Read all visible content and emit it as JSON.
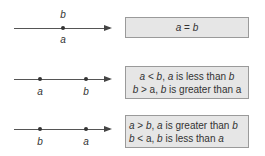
{
  "diagram": {
    "rows": [
      {
        "line": {
          "points": [
            {
              "label_above": "b",
              "label_below": "a",
              "x": 63
            }
          ]
        },
        "box": {
          "lines": [
            "a = b"
          ],
          "align": "center"
        }
      },
      {
        "line": {
          "points": [
            {
              "label_below": "a",
              "x": 40
            },
            {
              "label_below": "b",
              "x": 86
            }
          ]
        },
        "box": {
          "lines": [
            "a < b, a is less than b",
            "b > a, b is greater than a"
          ],
          "align": "center"
        }
      },
      {
        "line": {
          "points": [
            {
              "label_below": "b",
              "x": 40
            },
            {
              "label_below": "a",
              "x": 86
            }
          ]
        },
        "box": {
          "lines": [
            "a > b, a is greater than b",
            "b < a, b is less than a"
          ],
          "align": "left"
        }
      }
    ]
  },
  "labels": {
    "r1_above": "b",
    "r1_below": "a",
    "r2_p1": "a",
    "r2_p2": "b",
    "r3_p1": "b",
    "r3_p2": "a",
    "box1": {
      "v1": "a",
      "op": " = ",
      "v2": "b"
    },
    "box2": {
      "l1": {
        "v1": "a",
        "op": " < ",
        "v2": "b",
        "sep": ", ",
        "v3": "a",
        "text": " is less than ",
        "v4": "b"
      },
      "l2": {
        "v1": "b",
        "op": " > a, ",
        "v3": "b",
        "text": " is greater than a"
      }
    },
    "box3": {
      "l1": {
        "v1": "a",
        "op": " > ",
        "v2": "b",
        "sep": ", ",
        "v3": "a",
        "text": " is greater than ",
        "v4": "b"
      },
      "l2": {
        "v1": "b",
        "op": " < a, ",
        "v3": "b",
        "text": " is less than ",
        "v4": "a"
      }
    }
  },
  "colors": {
    "box_fill": "#e6e6e6",
    "box_border": "#9a9a9a",
    "line": "#555555"
  }
}
